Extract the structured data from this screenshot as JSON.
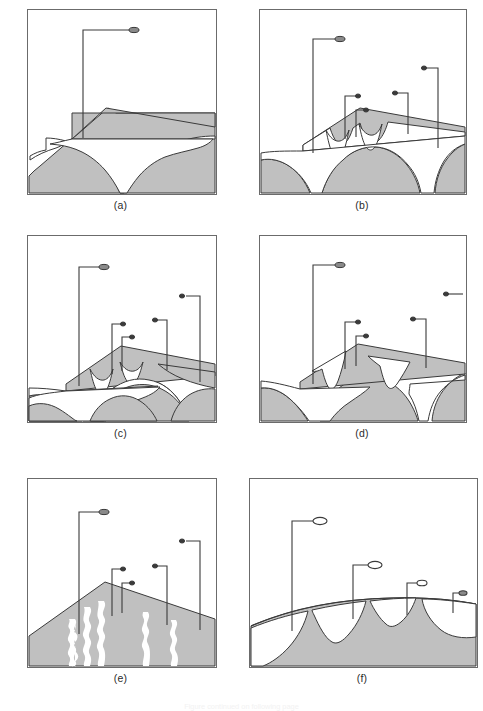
{
  "figure": {
    "panel_count": 6,
    "fill_gray": "#c0c0c0",
    "line_color": "#3a3a3a",
    "frame_color": "#6b6b6b",
    "background": "#ffffff",
    "white_fill": "#ffffff"
  },
  "panels": [
    {
      "id": "a",
      "label": "(a)",
      "description": "Single gray ridge with one broad white valley carved beneath it; one probe marker.",
      "marker_style": "filled-ellipse",
      "marker_count": 1,
      "valley_count": 1,
      "probes": [
        {
          "stem_x": 55,
          "stem_top": 20,
          "stem_bottom": 128,
          "arm_x2": 103,
          "marker_cx": 106,
          "marker_cy": 20,
          "rx": 5.0,
          "ry": 2.6
        }
      ]
    },
    {
      "id": "b",
      "label": "(b)",
      "description": "Terraced gray ridge with multiple white scalloped valleys at two depth levels; four probe markers.",
      "marker_style": "filled-ellipse",
      "marker_count": 4,
      "valley_count": 4,
      "probes": [
        {
          "stem_x": 53,
          "stem_top": 29,
          "stem_bottom": 143,
          "arm_x2": 77,
          "marker_cx": 80,
          "marker_cy": 29,
          "rx": 5.0,
          "ry": 2.6
        },
        {
          "stem_x": 85,
          "stem_top": 86,
          "stem_bottom": 129,
          "arm_x2": 96,
          "marker_cx": 98,
          "marker_cy": 86,
          "rx": 2.6,
          "ry": 2.0
        },
        {
          "stem_x": 96,
          "stem_top": 100,
          "stem_bottom": 127,
          "arm_x2": 104,
          "marker_cx": 106,
          "marker_cy": 100,
          "rx": 2.6,
          "ry": 2.0
        },
        {
          "stem_x": 148,
          "stem_top": 83,
          "stem_bottom": 124,
          "arm_x2": 137,
          "marker_cx": 135,
          "marker_cy": 83,
          "rx": 2.6,
          "ry": 2.0
        },
        {
          "stem_x": 178,
          "stem_top": 58,
          "stem_bottom": 138,
          "arm_x2": 166,
          "marker_cx": 164,
          "marker_cy": 58,
          "rx": 2.6,
          "ry": 2.0
        }
      ]
    },
    {
      "id": "c",
      "label": "(c)",
      "description": "Gray ridge with narrow white channels on upper terrace and a wide white band across the middle; five probe markers.",
      "marker_style": "filled-ellipse",
      "marker_count": 5,
      "valley_count": 4,
      "probes": [
        {
          "stem_x": 51,
          "stem_top": 31,
          "stem_bottom": 143,
          "arm_x2": 73,
          "marker_cx": 76,
          "marker_cy": 31,
          "rx": 5.0,
          "ry": 2.6
        },
        {
          "stem_x": 84,
          "stem_top": 88,
          "stem_bottom": 131,
          "arm_x2": 93,
          "marker_cx": 95,
          "marker_cy": 88,
          "rx": 2.6,
          "ry": 2.0
        },
        {
          "stem_x": 94,
          "stem_top": 101,
          "stem_bottom": 128,
          "arm_x2": 102,
          "marker_cx": 104,
          "marker_cy": 101,
          "rx": 2.6,
          "ry": 2.0
        },
        {
          "stem_x": 139,
          "stem_top": 84,
          "stem_bottom": 127,
          "arm_x2": 129,
          "marker_cx": 127,
          "marker_cy": 84,
          "rx": 2.6,
          "ry": 2.0
        },
        {
          "stem_x": 172,
          "stem_top": 60,
          "stem_bottom": 139,
          "arm_x2": 156,
          "marker_cx": 154,
          "marker_cy": 60,
          "rx": 2.6,
          "ry": 2.0
        }
      ]
    },
    {
      "id": "d",
      "label": "(d)",
      "description": "Gray ridge with deep white funnel-shaped incisions and wide white lowland; four probe markers, one at far right edge.",
      "marker_style": "filled-ellipse",
      "marker_count": 4,
      "valley_count": 4,
      "probes": [
        {
          "stem_x": 53,
          "stem_top": 29,
          "stem_bottom": 143,
          "arm_x2": 77,
          "marker_cx": 80,
          "marker_cy": 29,
          "rx": 5.0,
          "ry": 2.6
        },
        {
          "stem_x": 85,
          "stem_top": 86,
          "stem_bottom": 129,
          "arm_x2": 96,
          "marker_cx": 98,
          "marker_cy": 86,
          "rx": 2.6,
          "ry": 2.0
        },
        {
          "stem_x": 96,
          "stem_top": 100,
          "stem_bottom": 127,
          "arm_x2": 104,
          "marker_cx": 106,
          "marker_cy": 100,
          "rx": 2.6,
          "ry": 2.0
        },
        {
          "stem_x": 166,
          "stem_top": 83,
          "stem_bottom": 128,
          "arm_x2": 155,
          "marker_cx": 153,
          "marker_cy": 83,
          "rx": 2.6,
          "ry": 2.0
        },
        {
          "stem_x": 203,
          "stem_top": 58,
          "stem_bottom": 58,
          "arm_x2": 188,
          "marker_cx": 186,
          "marker_cy": 58,
          "rx": 2.6,
          "ry": 2.0
        }
      ]
    },
    {
      "id": "e",
      "label": "(e)",
      "description": "Solid gray triangular hill overlaid with five wiggly vertical white stripes; five probe markers.",
      "marker_style": "filled-ellipse",
      "marker_count": 5,
      "stripe_count": 5,
      "probes": [
        {
          "stem_x": 51,
          "stem_top": 33,
          "stem_bottom": 150,
          "arm_x2": 73,
          "marker_cx": 76,
          "marker_cy": 33,
          "rx": 5.0,
          "ry": 2.6
        },
        {
          "stem_x": 84,
          "stem_top": 90,
          "stem_bottom": 133,
          "arm_x2": 93,
          "marker_cx": 95,
          "marker_cy": 90,
          "rx": 2.6,
          "ry": 2.0
        },
        {
          "stem_x": 94,
          "stem_top": 104,
          "stem_bottom": 130,
          "arm_x2": 102,
          "marker_cx": 104,
          "marker_cy": 104,
          "rx": 2.6,
          "ry": 2.0
        },
        {
          "stem_x": 139,
          "stem_top": 87,
          "stem_bottom": 140,
          "arm_x2": 129,
          "marker_cx": 127,
          "marker_cy": 87,
          "rx": 2.6,
          "ry": 2.0
        },
        {
          "stem_x": 172,
          "stem_top": 62,
          "stem_bottom": 145,
          "arm_x2": 156,
          "marker_cx": 154,
          "marker_cy": 62,
          "rx": 2.6,
          "ry": 2.0
        }
      ]
    },
    {
      "id": "f",
      "label": "(f)",
      "description": "Gently curved gray ridge crest with large white scalloped valleys below; four hollow ellipse markers of decreasing height.",
      "marker_style": "hollow-ellipse",
      "marker_count": 4,
      "valley_count": 4,
      "probes": [
        {
          "stem_x": 42,
          "stem_top": 42,
          "stem_bottom": 152,
          "arm_x2": 64,
          "marker_cx": 70,
          "marker_cy": 42,
          "rx": 7.0,
          "ry": 3.6
        },
        {
          "stem_x": 103,
          "stem_top": 86,
          "stem_bottom": 140,
          "arm_x2": 119,
          "marker_cx": 125,
          "marker_cy": 86,
          "rx": 7.0,
          "ry": 3.6
        },
        {
          "stem_x": 157,
          "stem_top": 104,
          "stem_bottom": 136,
          "arm_x2": 168,
          "marker_cx": 172,
          "marker_cy": 104,
          "rx": 5.0,
          "ry": 2.8
        },
        {
          "stem_x": 203,
          "stem_top": 114,
          "stem_bottom": 134,
          "arm_x2": 210,
          "marker_cx": 213,
          "marker_cy": 114,
          "rx": 4.0,
          "ry": 2.3
        }
      ]
    }
  ],
  "footer": {
    "caption_fragment": "Figure continued on following page"
  }
}
